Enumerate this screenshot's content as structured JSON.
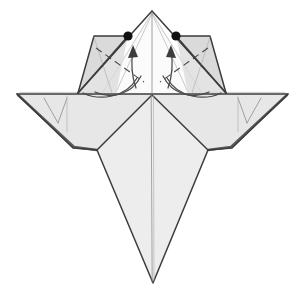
{
  "figure": {
    "title": "Origami folding diagram step",
    "canvas": {
      "width": 304,
      "height": 294,
      "background": "#ffffff"
    },
    "palette": {
      "paper_light": "#ededed",
      "paper_mid": "#d9d9d9",
      "paper_white": "#fbfbfb",
      "edge_major": "#3c3c3c",
      "edge_thin": "#8d8d8d",
      "crease": "#4a4a4a",
      "reference_dot": "#111111"
    },
    "parts": {
      "apex_label": "top point",
      "left_flap_label": "left upper flap",
      "right_flap_label": "right upper flap",
      "left_wing_label": "left wing",
      "right_wing_label": "right wing",
      "tail_label": "bottom tail point",
      "center_crease_label": "vertical center crease",
      "horizontal_edge_label": "horizontal folded edge"
    },
    "annotations": {
      "dot_count": 2,
      "dot_left": {
        "x": 128,
        "y": 36
      },
      "dot_right": {
        "x": 176,
        "y": 36
      },
      "arrow_count": 2,
      "arrow_left_direction": "up",
      "arrow_right_direction": "up",
      "crease_count": 2,
      "crease_type": "valley"
    },
    "geometry": {
      "apex": {
        "x": 152,
        "y": 11
      },
      "left_wing_tip": {
        "x": 17,
        "y": 94
      },
      "right_wing_tip": {
        "x": 288,
        "y": 94
      },
      "tail_tip": {
        "x": 153,
        "y": 283
      },
      "horizontal_edge_y": 94
    }
  }
}
